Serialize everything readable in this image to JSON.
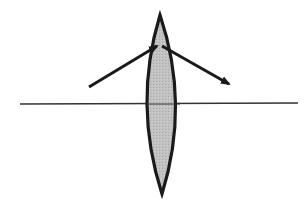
{
  "diagram": {
    "title": "Converging lens refracting a light ray",
    "colors": {
      "background": "#ffffff",
      "lens_fill": "#bdbdbd",
      "lens_stroke": "#1a1a1a",
      "ray": "#1a1a1a",
      "axis": "#333333"
    },
    "elements": {
      "optical_axis": {
        "label": "optical axis",
        "x1": 20,
        "y1": 104,
        "x2": 298,
        "y2": 103
      },
      "lens": {
        "label": "biconvex lens",
        "top": [
          160,
          15
        ],
        "bottom": [
          162,
          194
        ],
        "left_x": 143,
        "right_x": 181,
        "center_y": 104
      },
      "incident_ray": {
        "label": "incident ray",
        "from": [
          89,
          87
        ],
        "to": [
          157,
          46
        ]
      },
      "refracted_ray": {
        "label": "refracted ray",
        "from": [
          162,
          46
        ],
        "to": [
          229,
          84
        ]
      }
    }
  }
}
